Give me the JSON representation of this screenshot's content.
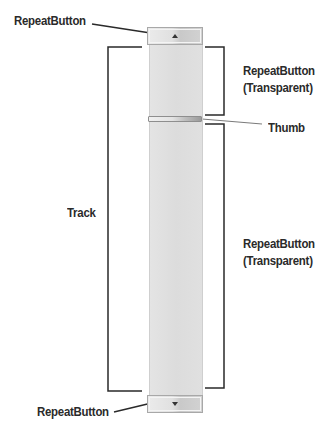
{
  "diagram": {
    "labels": {
      "top_button": "RepeatButton",
      "upper_track": "RepeatButton",
      "upper_track_sub": "(Transparent)",
      "thumb": "Thumb",
      "track": "Track",
      "lower_track": "RepeatButton",
      "lower_track_sub": "(Transparent)",
      "bottom_button": "RepeatButton"
    },
    "icons": {
      "top_button_arrow": "arrow-up-icon",
      "bottom_button_arrow": "arrow-down-icon"
    },
    "colors": {
      "line": "#2a2a2a",
      "track": "#dedede",
      "button_border": "#a8a8a8",
      "thumb_border": "#8e8e8e"
    }
  }
}
